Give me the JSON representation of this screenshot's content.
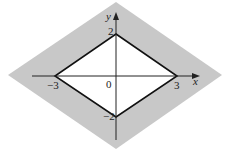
{
  "diagram": {
    "type": "region-plot",
    "axes": {
      "x_label": "x",
      "y_label": "y",
      "origin_label": "0"
    },
    "vertices": {
      "x_pos": "3",
      "x_neg": "−3",
      "y_pos": "2",
      "y_neg": "−2"
    },
    "colors": {
      "shaded_region": "#c8c8c8",
      "inner_region": "#ffffff",
      "boundary": "#111111",
      "axes": "#222222"
    }
  }
}
